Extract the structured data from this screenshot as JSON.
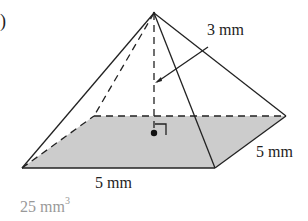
{
  "figure": {
    "part_marker": ")",
    "shape": "square pyramid",
    "labels": {
      "height": "3 mm",
      "base_front": "5 mm",
      "base_side": "5 mm"
    },
    "answer": {
      "value": "25 mm",
      "exponent": "3"
    },
    "colors": {
      "stroke": "#222222",
      "base_fill": "#cccccc",
      "answer_text": "#999999"
    }
  }
}
